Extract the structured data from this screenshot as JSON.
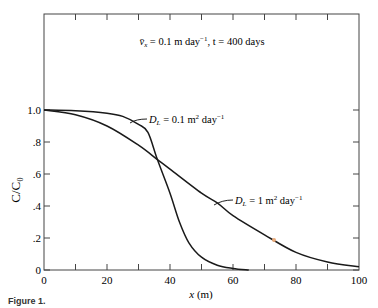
{
  "chart_data": {
    "type": "line",
    "xlabel": "x (m)",
    "ylabel": "C/C₀",
    "xlim": [
      0,
      100
    ],
    "ylim": [
      0,
      1.0
    ],
    "x_ticks": [
      "0",
      "20",
      "40",
      "60",
      "80",
      "100"
    ],
    "y_ticks": [
      "0",
      ".2",
      ".4",
      ".6",
      ".8",
      "1.0"
    ],
    "grid": false,
    "series": [
      {
        "name": "D_L = 0.1 m² day⁻¹",
        "x": [
          0,
          10,
          20,
          25,
          30,
          33,
          36,
          40,
          43,
          46,
          50,
          55,
          60,
          65
        ],
        "values": [
          1.0,
          0.995,
          0.98,
          0.96,
          0.91,
          0.86,
          0.69,
          0.48,
          0.3,
          0.17,
          0.08,
          0.03,
          0.01,
          0.0
        ]
      },
      {
        "name": "D_L = 1 m² day⁻¹",
        "x": [
          0,
          10,
          20,
          30,
          36,
          40,
          50,
          55,
          60,
          70,
          80,
          90,
          100
        ],
        "values": [
          1.0,
          0.97,
          0.9,
          0.78,
          0.69,
          0.63,
          0.48,
          0.42,
          0.34,
          0.22,
          0.11,
          0.05,
          0.02
        ]
      }
    ],
    "annotations": [
      {
        "text_main": "D",
        "text_sub": "L",
        "text_rest": " = 0.1 m",
        "sup1": "2",
        "text_day": " day",
        "sup2": "−1"
      },
      {
        "text_main": "D",
        "text_sub": "L",
        "text_rest": " = 1 m",
        "sup1": "2",
        "text_day": " day",
        "sup2": "−1"
      }
    ],
    "header_annotation": {
      "v": "v̄",
      "sub": "x",
      "rest": " = 0.1 m day",
      "sup": "−1",
      "tail": ", t = 400 days"
    }
  },
  "caption": "Figure 1."
}
